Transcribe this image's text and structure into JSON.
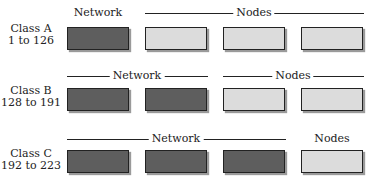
{
  "diagram": {
    "rows": [
      {
        "class_name": "Class A",
        "range": "1 to 126",
        "network_label": "Network",
        "nodes_label": "Nodes",
        "octets": [
          "network",
          "node",
          "node",
          "node"
        ]
      },
      {
        "class_name": "Class B",
        "range": "128 to 191",
        "network_label": "Network",
        "nodes_label": "Nodes",
        "octets": [
          "network",
          "network",
          "node",
          "node"
        ]
      },
      {
        "class_name": "Class C",
        "range": "192 to 223",
        "network_label": "Network",
        "nodes_label": "Nodes",
        "octets": [
          "network",
          "network",
          "network",
          "node"
        ]
      }
    ],
    "colors": {
      "network": "#5e5e5e",
      "node": "#dcdcdc",
      "border": "#222222"
    }
  }
}
